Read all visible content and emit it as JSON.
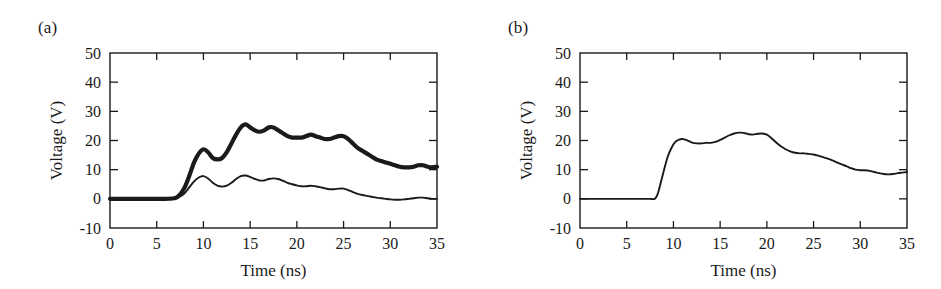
{
  "figure": {
    "background_color": "#ffffff",
    "line_color": "#1a1a1a",
    "panel_a_label": "(a)",
    "panel_b_label": "(b)"
  },
  "chart_data": [
    {
      "panel": "(a)",
      "type": "line",
      "title": "",
      "xlabel": "Time (ns)",
      "ylabel": "Voltage (V)",
      "xlim": [
        0,
        35
      ],
      "ylim": [
        -10,
        50
      ],
      "xticks": [
        0,
        5,
        10,
        15,
        20,
        25,
        30,
        35
      ],
      "yticks": [
        -10,
        0,
        10,
        20,
        30,
        40,
        50
      ],
      "xtick_labels": [
        "0",
        "5",
        "10",
        "15",
        "20",
        "25",
        "30",
        "35"
      ],
      "ytick_labels": [
        "-10",
        "0",
        "10",
        "20",
        "30",
        "40",
        "50"
      ],
      "grid": false,
      "legend": "none",
      "series": [
        {
          "name": "upper-trace-thick",
          "style": "thick-noisy",
          "x": [
            0,
            1,
            2,
            3,
            4,
            5,
            6,
            7,
            7.5,
            8,
            8.5,
            9,
            9.5,
            10,
            10.5,
            11,
            11.5,
            12,
            12.5,
            13,
            13.5,
            14,
            14.5,
            15,
            15.5,
            16,
            16.5,
            17,
            17.5,
            18,
            18.5,
            19,
            19.5,
            20,
            20.5,
            21,
            21.5,
            22,
            22.5,
            23,
            23.5,
            24,
            24.5,
            25,
            25.5,
            26,
            26.5,
            27,
            27.5,
            28,
            28.5,
            29,
            29.5,
            30,
            30.5,
            31,
            31.5,
            32,
            32.5,
            33,
            33.5,
            34,
            34.5,
            35
          ],
          "y": [
            0,
            0,
            0,
            0,
            0,
            0,
            0,
            0.3,
            1.5,
            4,
            8,
            12.5,
            15.5,
            17,
            16,
            14,
            13.5,
            14,
            16,
            19,
            22,
            24.5,
            25.5,
            24.5,
            23.5,
            23,
            23.5,
            24.5,
            24.5,
            23.5,
            22.5,
            21.5,
            21,
            21,
            21,
            21.5,
            22,
            21.5,
            21,
            20.5,
            20.5,
            21,
            21.5,
            21.5,
            20.5,
            19,
            17.5,
            16.5,
            15.5,
            14.5,
            13.5,
            13,
            12.5,
            12,
            11.5,
            11,
            10.8,
            10.8,
            11,
            11.5,
            11.5,
            11,
            10.8,
            11
          ]
        },
        {
          "name": "lower-trace-thin",
          "style": "thin",
          "x": [
            0,
            1,
            2,
            3,
            4,
            5,
            6,
            7,
            7.5,
            8,
            8.5,
            9,
            9.5,
            10,
            10.5,
            11,
            11.5,
            12,
            12.5,
            13,
            13.5,
            14,
            14.5,
            15,
            15.5,
            16,
            16.5,
            17,
            17.5,
            18,
            18.5,
            19,
            19.5,
            20,
            20.5,
            21,
            21.5,
            22,
            22.5,
            23,
            23.5,
            24,
            24.5,
            25,
            25.5,
            26,
            26.5,
            27,
            27.5,
            28,
            28.5,
            29,
            29.5,
            30,
            30.5,
            31,
            31.5,
            32,
            32.5,
            33,
            33.5,
            34,
            34.5,
            35
          ],
          "y": [
            0,
            0,
            0,
            0,
            0,
            0,
            0,
            0.2,
            0.8,
            2,
            4,
            6,
            7.3,
            7.8,
            7,
            5.5,
            4.5,
            4.2,
            4.5,
            5.5,
            6.8,
            7.8,
            8,
            7.5,
            6.8,
            6.3,
            6.3,
            6.8,
            7,
            6.8,
            6.2,
            5.5,
            5,
            4.6,
            4.3,
            4.3,
            4.5,
            4.3,
            4,
            3.6,
            3.3,
            3.3,
            3.5,
            3.5,
            3,
            2.3,
            1.7,
            1.3,
            1,
            0.7,
            0.4,
            0.2,
            0,
            -0.2,
            -0.3,
            -0.3,
            -0.2,
            0,
            0.2,
            0.4,
            0.4,
            0.2,
            0,
            0
          ]
        }
      ]
    },
    {
      "panel": "(b)",
      "type": "line",
      "title": "",
      "xlabel": "Time (ns)",
      "ylabel": "Voltage (V)",
      "xlim": [
        0,
        35
      ],
      "ylim": [
        -10,
        50
      ],
      "xticks": [
        0,
        5,
        10,
        15,
        20,
        25,
        30,
        35
      ],
      "yticks": [
        -10,
        0,
        10,
        20,
        30,
        40,
        50
      ],
      "xtick_labels": [
        "0",
        "5",
        "10",
        "15",
        "20",
        "25",
        "30",
        "35"
      ],
      "ytick_labels": [
        "-10",
        "0",
        "10",
        "20",
        "30",
        "40",
        "50"
      ],
      "grid": false,
      "legend": "none",
      "series": [
        {
          "name": "main-trace",
          "style": "thin",
          "x": [
            0,
            1,
            2,
            3,
            4,
            5,
            6,
            7,
            7.5,
            8,
            8.3,
            8.6,
            9,
            9.4,
            9.8,
            10.2,
            10.6,
            11,
            11.5,
            12,
            12.5,
            13,
            13.5,
            14,
            14.5,
            15,
            15.5,
            16,
            16.5,
            17,
            17.5,
            18,
            18.5,
            19,
            19.5,
            20,
            20.5,
            21,
            21.5,
            22,
            22.5,
            23,
            23.5,
            24,
            24.5,
            25,
            25.5,
            26,
            26.5,
            27,
            27.5,
            28,
            28.5,
            29,
            29.5,
            30,
            30.5,
            31,
            31.5,
            32,
            32.5,
            33,
            33.5,
            34,
            34.5,
            35
          ],
          "y": [
            0,
            0,
            0,
            0,
            0,
            0,
            0,
            0,
            0,
            0,
            1.5,
            5,
            10,
            14.5,
            17.5,
            19.5,
            20.3,
            20.5,
            20,
            19.3,
            19,
            19,
            19.2,
            19.2,
            19.5,
            20.2,
            21,
            21.8,
            22.4,
            22.7,
            22.6,
            22.2,
            22,
            22.3,
            22.4,
            22,
            20.8,
            19.3,
            18,
            17,
            16.3,
            15.8,
            15.6,
            15.6,
            15.4,
            15.2,
            14.8,
            14.3,
            13.8,
            13.2,
            12.5,
            11.8,
            11.2,
            10.5,
            10,
            9.8,
            9.8,
            9.6,
            9.2,
            8.8,
            8.5,
            8.4,
            8.5,
            8.8,
            9,
            9.2
          ]
        }
      ]
    }
  ]
}
